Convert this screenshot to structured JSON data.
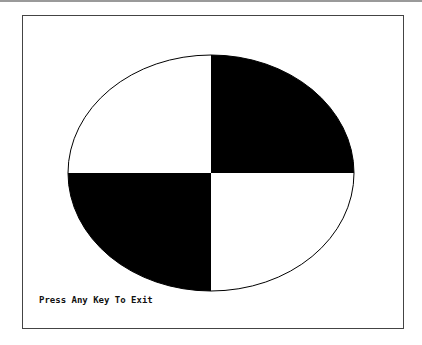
{
  "screen": {
    "message": "Press Any Key To Exit"
  },
  "graphic": {
    "shape": "ellipse",
    "center": [
      211,
      173
    ],
    "radii": [
      143,
      118
    ],
    "quadrants": {
      "top_left": "#ffffff",
      "top_right": "#000000",
      "bottom_left": "#000000",
      "bottom_right": "#ffffff"
    },
    "outline_color": "#000000"
  },
  "colors": {
    "background": "#ffffff",
    "frame": "#444444",
    "fill": "#000000"
  }
}
